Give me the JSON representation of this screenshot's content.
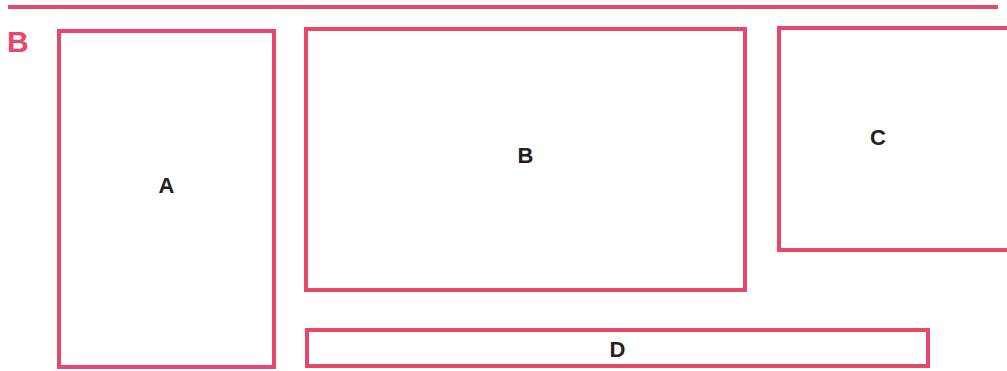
{
  "figure": {
    "label": "B",
    "accent_color": "#e8476c",
    "text_color": "#231f20"
  },
  "boxes": [
    {
      "id": "A",
      "label": "A"
    },
    {
      "id": "B",
      "label": "B"
    },
    {
      "id": "C",
      "label": "C"
    },
    {
      "id": "D",
      "label": "D"
    }
  ]
}
